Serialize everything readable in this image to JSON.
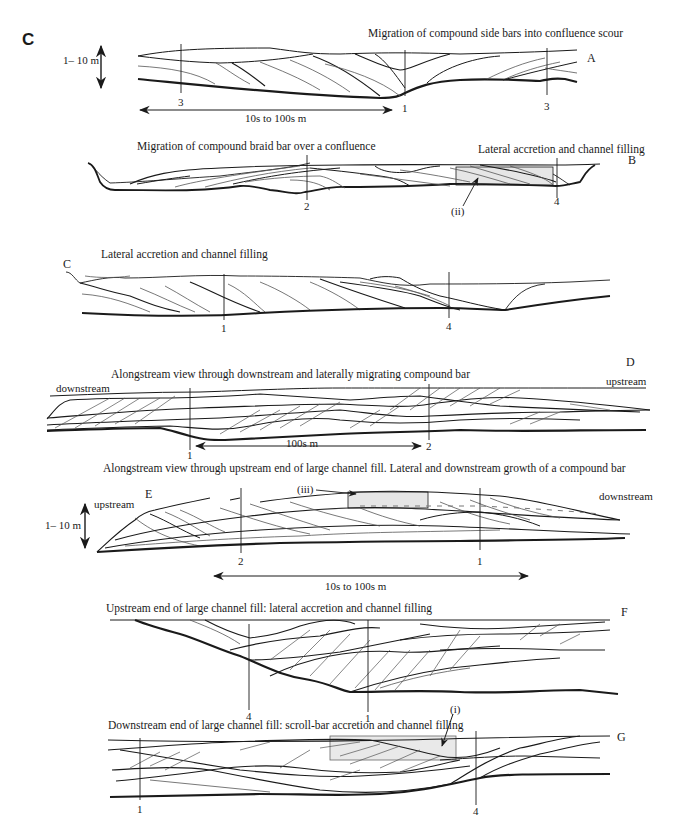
{
  "figure": {
    "panel_label": "C",
    "sections": [
      {
        "id": "A",
        "title": "Migration of compound side bars into confluence scour",
        "vertical_lines": [
          "3",
          "1",
          "3"
        ],
        "scale_vertical": "1– 10 m",
        "scale_horizontal": "10s to 100s m"
      },
      {
        "id": "B",
        "title_left": "Migration of compound braid bar over a confluence",
        "title_right": "Lateral accretion and channel filling",
        "vertical_lines": [
          "2",
          "4"
        ],
        "callout": "(ii)"
      },
      {
        "id": "C",
        "title": "Lateral accretion and channel filling",
        "vertical_lines": [
          "1",
          "4"
        ]
      },
      {
        "id": "D",
        "title": "Alongstream view through downstream and laterally migrating compound bar",
        "left_label": "downstream",
        "right_label": "upstream",
        "vertical_lines": [
          "1",
          "2"
        ],
        "scale_horizontal": "100s m"
      },
      {
        "id": "E",
        "title": "Alongstream view through upstream end of large channel fill. Lateral and downstream growth of a compound bar",
        "left_label": "upstream",
        "right_label": "downstream",
        "vertical_lines": [
          "2",
          "1"
        ],
        "callout": "(iii)",
        "scale_vertical": "1– 10 m",
        "scale_horizontal": "10s to 100s m"
      },
      {
        "id": "F",
        "title": "Upstream end of large channel fill: lateral accretion and channel filling",
        "vertical_lines": [
          "4",
          "1"
        ]
      },
      {
        "id": "G",
        "title": "Downstream end of large channel fill: scroll-bar accretion and channel filling",
        "vertical_lines": [
          "1",
          "4"
        ],
        "callout": "(i)"
      }
    ],
    "colors": {
      "line": "#1a1a1a",
      "thin_line": "#555555",
      "highlight_fill": "#e6e6e6",
      "background": "#ffffff"
    }
  }
}
